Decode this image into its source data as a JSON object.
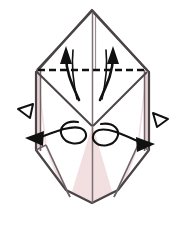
{
  "figure": {
    "type": "origami-instruction-diagram",
    "caption": "",
    "canvas": {
      "width": 187,
      "height": 227,
      "background": "#ffffff"
    }
  },
  "palette": {
    "paper_fill": "#f2dfe0",
    "paper_fill_white": "#ffffff",
    "paper_fill_shadow": "#e8d2d4",
    "outline": "#4a4446",
    "outline_light": "#8a8084",
    "crease_line": "#7a7074",
    "arrow_solid": "#111111",
    "arrow_hollow_stroke": "#111111",
    "arrow_hollow_fill": "#ffffff",
    "dashed_fold_line": "#111111"
  },
  "shapes": {
    "outer_body": {
      "name": "folded-paper-body",
      "points": "92,10 145,68 149,72 149,150 118,190 92,203 66,190 36,150 36,72 40,68"
    },
    "top_peak_left": {
      "name": "top-peak-left-facet",
      "points": "92,12 36,70 88,70 88,12"
    },
    "top_peak_right": {
      "name": "top-peak-right-facet",
      "points": "95,12 95,70 147,70"
    },
    "left_pink_panel": {
      "name": "left-pink-panel",
      "points": "37,72 92,126 92,200 64,188 47,146"
    },
    "right_pink_panel": {
      "name": "right-pink-panel",
      "points": "147,72 93,126 93,200 120,188 137,146"
    },
    "left_white_wedge": {
      "name": "left-white-inner-wedge",
      "points": "37,72 92,126 70,196 48,148"
    },
    "right_white_wedge": {
      "name": "right-white-inner-wedge",
      "points": "147,72 93,126 114,196 136,148"
    },
    "bottom_left_flap": {
      "name": "bottom-left-flap",
      "points": "36,150 47,146 66,190 63,192"
    },
    "bottom_right_flap": {
      "name": "bottom-right-flap",
      "points": "149,150 137,146 118,190 121,192"
    }
  },
  "creases": {
    "center_vertical": {
      "name": "center-vertical-crease",
      "x1": 92.5,
      "y1": 12,
      "x2": 92.5,
      "y2": 203
    },
    "left_diagonal": {
      "name": "left-diagonal-crease",
      "x1": 37,
      "y1": 72,
      "x2": 92,
      "y2": 126
    },
    "right_diagonal": {
      "name": "right-diagonal-crease",
      "x1": 147,
      "y1": 72,
      "x2": 93,
      "y2": 126
    },
    "left_inner": {
      "name": "left-inner-crease",
      "x1": 47,
      "y1": 146,
      "x2": 70,
      "y2": 196
    },
    "right_inner": {
      "name": "right-inner-crease",
      "x1": 137,
      "y1": 146,
      "x2": 114,
      "y2": 196
    },
    "left_edge_inner": {
      "name": "left-edge-inner-crease",
      "x1": 40,
      "y1": 70,
      "x2": 40,
      "y2": 150
    },
    "right_edge_inner": {
      "name": "right-edge-inner-crease",
      "x1": 145,
      "y1": 70,
      "x2": 145,
      "y2": 150
    }
  },
  "fold_line": {
    "name": "horizontal-valley-fold-dashed-line",
    "style": "dashed",
    "x1": 38,
    "y1": 70,
    "x2": 147,
    "y2": 70,
    "dash_pattern": "7 4",
    "width": 2.6
  },
  "arrows": [
    {
      "id": "fold-up-arrow-left",
      "name": "fold-up-arrow-left",
      "kind": "solid-curved",
      "meaning": "fold flap upward",
      "direction": "up",
      "tip": {
        "x": 66,
        "y": 50
      },
      "tail": {
        "x": 78,
        "y": 100
      }
    },
    {
      "id": "fold-up-arrow-right",
      "name": "fold-up-arrow-right",
      "kind": "solid-curved",
      "meaning": "fold flap upward",
      "direction": "up",
      "tip": {
        "x": 113,
        "y": 50
      },
      "tail": {
        "x": 101,
        "y": 100
      }
    },
    {
      "id": "pull-out-arrow-left",
      "name": "pull-out-hollow-arrow-left",
      "kind": "hollow",
      "meaning": "pull paper out",
      "direction": "up-left",
      "tip": {
        "x": 19,
        "y": 110
      }
    },
    {
      "id": "pull-out-arrow-right",
      "name": "pull-out-hollow-arrow-right",
      "kind": "hollow",
      "meaning": "pull paper out",
      "direction": "down-right",
      "tip": {
        "x": 166,
        "y": 118
      }
    },
    {
      "id": "spread-arrow-left",
      "name": "spread-open-arrow-left",
      "kind": "solid-looped",
      "meaning": "spread / open layer outward",
      "direction": "left",
      "tip": {
        "x": 30,
        "y": 139
      },
      "loop_center": {
        "x": 68,
        "y": 135
      }
    },
    {
      "id": "spread-arrow-right",
      "name": "spread-open-arrow-right",
      "kind": "solid-looped",
      "meaning": "spread / open layer outward",
      "direction": "right",
      "tip": {
        "x": 150,
        "y": 144
      },
      "loop_center": {
        "x": 114,
        "y": 137
      }
    }
  ]
}
